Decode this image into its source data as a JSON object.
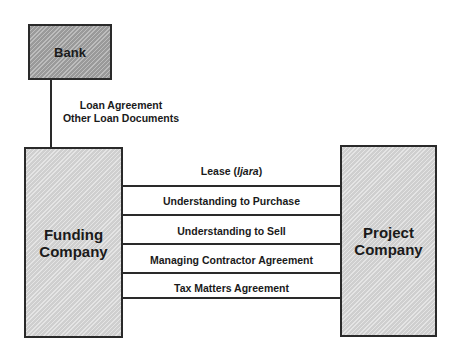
{
  "entities": {
    "bank": "Bank",
    "funding_line1": "Funding",
    "funding_line2": "Company",
    "project_line1": "Project",
    "project_line2": "Company"
  },
  "loan_link": {
    "line1": "Loan Agreement",
    "line2": "Other Loan Documents"
  },
  "agreements": [
    {
      "label_prefix": "Lease (",
      "label_italic": "Ijara",
      "label_suffix": ")"
    },
    {
      "label": "Understanding to Purchase"
    },
    {
      "label": "Understanding to Sell"
    },
    {
      "label": "Managing Contractor Agreement"
    },
    {
      "label": "Tax Matters Agreement"
    }
  ],
  "colors": {
    "bank_fill": "#9a9a9a",
    "company_fill": "#cfcfcf",
    "line": "#2a2a2a"
  }
}
